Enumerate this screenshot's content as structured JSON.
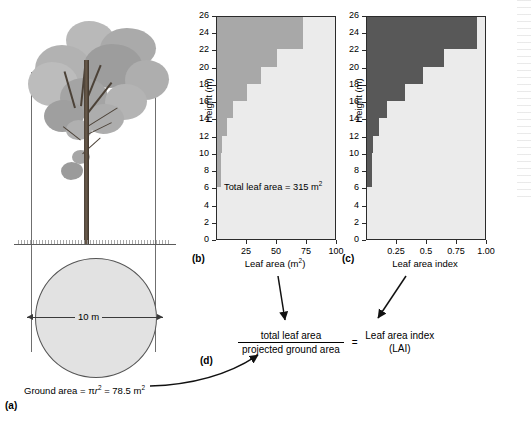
{
  "figure": {
    "panel_a_label": "(a)",
    "panel_b_label": "(b)",
    "panel_c_label": "(c)",
    "panel_d_label": "(d)",
    "ground_equation": "Ground area = πr² = 78.5 m²",
    "diameter_label": "10 m"
  },
  "equation": {
    "numerator": "total leaf area",
    "denominator": "projected ground area",
    "equals": "=",
    "result_line1": "Leaf area index",
    "result_line2": "(LAI)"
  },
  "colors": {
    "bar_b": "#a8a8a8",
    "bar_c": "#585858",
    "plot_background": "#ebebeb",
    "axis": "#2b2b2b",
    "canopy_light": "#b6b6b6",
    "canopy_mid": "#9e9e9e",
    "canopy_dark": "#8a8a8a",
    "trunk": "#4c4238"
  },
  "chart_data": [
    {
      "type": "bar",
      "orientation": "horizontal",
      "panel": "(b)",
      "title": "",
      "xlabel": "Leaf area (m²)",
      "ylabel": "Height (m)",
      "xlim": [
        0,
        100
      ],
      "ylim": [
        0,
        26
      ],
      "xticks": [
        "25",
        "50",
        "75",
        "100"
      ],
      "xtick_values": [
        25,
        50,
        75,
        100
      ],
      "yticks": [
        "0",
        "2",
        "4",
        "6",
        "8",
        "10",
        "12",
        "14",
        "16",
        "18",
        "20",
        "22",
        "24",
        "26"
      ],
      "ytick_values": [
        0,
        2,
        4,
        6,
        8,
        10,
        12,
        14,
        16,
        18,
        20,
        22,
        24,
        26
      ],
      "grid": false,
      "legend": false,
      "annotation": "Total leaf area = 315 m²",
      "bar_color": "#a8a8a8",
      "categories": [
        "0-2",
        "2-4",
        "4-6",
        "6-8",
        "8-10",
        "10-12",
        "12-14",
        "14-16",
        "16-18",
        "18-20",
        "20-22",
        "22-24",
        "24-26"
      ],
      "values": [
        0,
        0,
        0,
        3,
        3,
        4,
        8,
        13,
        25,
        37,
        50,
        72,
        72
      ]
    },
    {
      "type": "bar",
      "orientation": "horizontal",
      "panel": "(c)",
      "title": "",
      "xlabel": "Leaf area index",
      "ylabel": "Height (m)",
      "xlim": [
        0,
        1.0
      ],
      "ylim": [
        0,
        26
      ],
      "xticks": [
        "0.25",
        "0.5",
        "0.75",
        "1.00"
      ],
      "xtick_values": [
        0.25,
        0.5,
        0.75,
        1.0
      ],
      "yticks": [
        "0",
        "2",
        "4",
        "6",
        "8",
        "10",
        "12",
        "14",
        "16",
        "18",
        "20",
        "22",
        "24",
        "26"
      ],
      "ytick_values": [
        0,
        2,
        4,
        6,
        8,
        10,
        12,
        14,
        16,
        18,
        20,
        22,
        24,
        26
      ],
      "grid": false,
      "legend": false,
      "bar_color": "#585858",
      "categories": [
        "0-2",
        "2-4",
        "4-6",
        "6-8",
        "8-10",
        "10-12",
        "12-14",
        "14-16",
        "16-18",
        "18-20",
        "20-22",
        "22-24",
        "24-26"
      ],
      "values": [
        0,
        0,
        0,
        0.04,
        0.04,
        0.05,
        0.1,
        0.17,
        0.32,
        0.47,
        0.64,
        0.92,
        0.92
      ]
    }
  ]
}
